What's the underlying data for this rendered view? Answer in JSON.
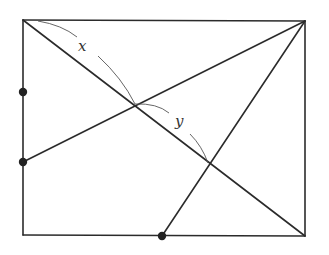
{
  "diagram": {
    "title": "",
    "colors": {
      "line": "#2b2b2b",
      "arc": "#555555",
      "dot": "#222222",
      "background": "#ffffff"
    },
    "labels": {
      "x": "x",
      "y": "y"
    },
    "points": {
      "top_left": [
        23,
        20
      ],
      "top_right": [
        305,
        21
      ],
      "bottom_right": [
        305,
        236
      ],
      "bottom_left": [
        23,
        235
      ],
      "left_dot_upper": [
        23,
        92
      ],
      "left_dot_lower": [
        23,
        162
      ],
      "bottom_dot": [
        162,
        236
      ],
      "intersection_1": [
        135,
        104
      ],
      "intersection_2": [
        208,
        163
      ]
    },
    "nodes": [
      {
        "id": "left_dot_upper",
        "marked": true
      },
      {
        "id": "left_dot_lower",
        "marked": true
      },
      {
        "id": "bottom_dot",
        "marked": true
      }
    ],
    "segments": [
      {
        "id": "rect-top",
        "from": "top_left",
        "to": "top_right"
      },
      {
        "id": "rect-right",
        "from": "top_right",
        "to": "bottom_right"
      },
      {
        "id": "rect-bottom",
        "from": "bottom_left",
        "to": "bottom_right"
      },
      {
        "id": "rect-left",
        "from": "top_left",
        "to": "bottom_left"
      },
      {
        "id": "diagonal",
        "from": "top_left",
        "to": "bottom_right"
      },
      {
        "id": "line-to-left-dot",
        "from": "top_right",
        "to": "left_dot_lower"
      },
      {
        "id": "line-to-bottom-dot",
        "from": "top_right",
        "to": "bottom_dot"
      }
    ],
    "arcs": [
      {
        "label": "x",
        "from": "top_left",
        "to": "intersection_1"
      },
      {
        "label": "y",
        "from": "intersection_1",
        "to": "intersection_2"
      }
    ]
  }
}
